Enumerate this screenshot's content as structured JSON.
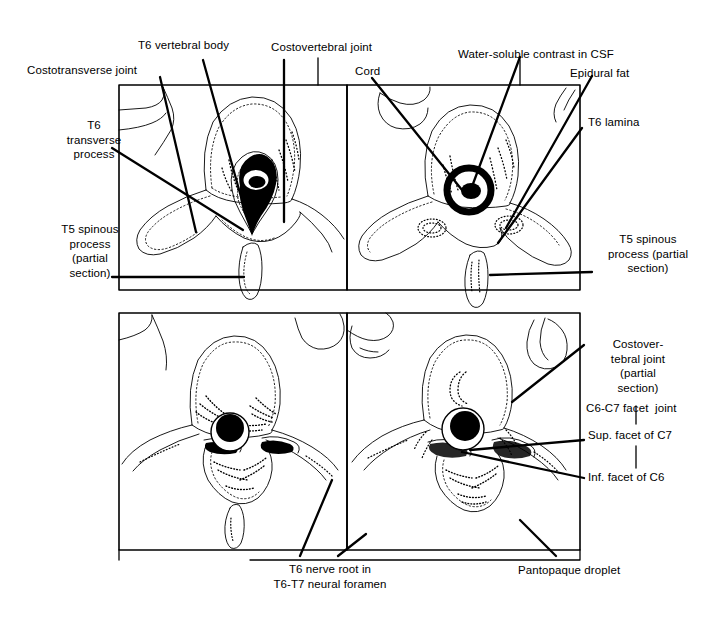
{
  "figure": {
    "stroke_color": "#000000",
    "background_color": "#ffffff",
    "panel_count": 4
  },
  "panels": [
    {
      "id": "panel-top-left",
      "position": "top-left",
      "region": "T6 thoracic vertebra axial section"
    },
    {
      "id": "panel-top-right",
      "position": "top-right",
      "region": "T6 thoracic vertebra with water-soluble contrast"
    },
    {
      "id": "panel-bottom-left",
      "position": "bottom-left",
      "region": "T6-T7 neural foramen level section"
    },
    {
      "id": "panel-bottom-right",
      "position": "bottom-right",
      "region": "C6-C7 cervical facet joint section"
    }
  ],
  "labels": {
    "costotransverse_joint": "Costotransverse joint",
    "t6_vertebral_body": "T6 vertebral body",
    "costovertebral_joint": "Costovertebral joint",
    "water_soluble_contrast": "Water-soluble contrast in CSF",
    "cord": "Cord",
    "epidural_fat": "Epidural fat",
    "t6_lamina": "T6 lamina",
    "t6_transverse_process": "T6\ntransverse\nprocess",
    "t5_spinous_process_left": "T5 spinous\nprocess\n(partial\nsection)",
    "t5_spinous_process_right": "T5 spinous\nprocess (partial\nsection)",
    "costovertebral_joint_partial": "Costover-\ntebral joint\n(partial\nsection)",
    "c6_c7_facet_joint": "C6-C7 facet  joint",
    "sup_facet_c7": "Sup. facet of C7",
    "inf_facet_c6": "Inf. facet of C6",
    "t6_nerve_root": "T6 nerve root in\nT6-T7 neural foramen",
    "pantopaque_droplet": "Pantopaque droplet"
  }
}
